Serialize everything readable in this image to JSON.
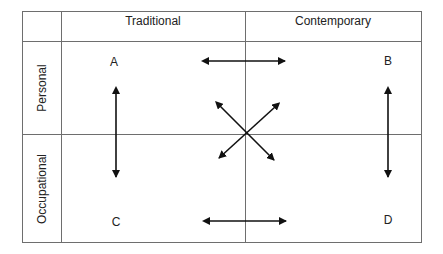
{
  "columns": [
    {
      "label": "Traditional"
    },
    {
      "label": "Contemporary"
    }
  ],
  "rows": [
    {
      "label": "Personal"
    },
    {
      "label": "Occupational"
    }
  ],
  "quadrants": {
    "top_left": "A",
    "top_right": "B",
    "bottom_left": "C",
    "bottom_right": "D"
  },
  "arrows": [
    {
      "id": "A-B",
      "type": "double-headed",
      "orientation": "horizontal"
    },
    {
      "id": "C-D",
      "type": "double-headed",
      "orientation": "horizontal"
    },
    {
      "id": "A-C",
      "type": "double-headed",
      "orientation": "vertical"
    },
    {
      "id": "B-D",
      "type": "double-headed",
      "orientation": "vertical"
    },
    {
      "id": "A-D",
      "type": "double-headed",
      "orientation": "diagonal"
    },
    {
      "id": "B-C",
      "type": "double-headed",
      "orientation": "diagonal"
    }
  ],
  "colors": {
    "grid_line": "#6e6e6e",
    "arrow": "#111111",
    "text": "#222222",
    "background": "#ffffff"
  }
}
